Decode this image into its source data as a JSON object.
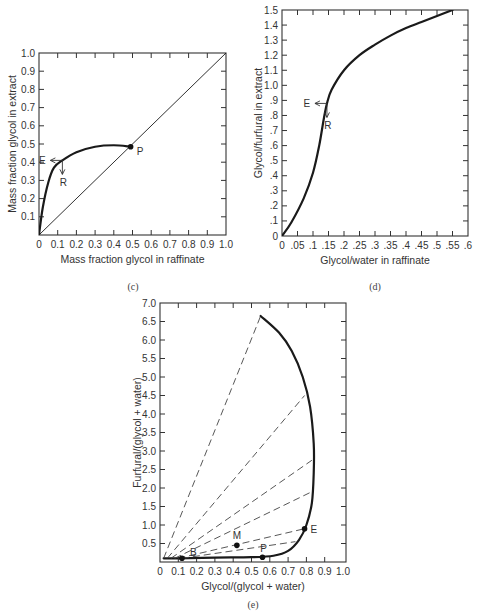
{
  "chart_data": [
    {
      "id": "c",
      "type": "line",
      "caption": "(c)",
      "xlabel": "Mass fraction glycol in raffinate",
      "ylabel": "Mass fraction glycol in extract",
      "xlim": [
        0,
        1.0
      ],
      "ylim": [
        0,
        1.0
      ],
      "xticks": [
        "0",
        "0.1",
        "0.2",
        "0.3",
        "0.4",
        "0.5",
        "0.6",
        "0.7",
        "0.8",
        "0.9",
        "1.0"
      ],
      "yticks": [
        "0.1",
        "0.2",
        "0.3",
        "0.4",
        "0.5",
        "0.6",
        "0.7",
        "0.8",
        "0.9",
        "1.0"
      ],
      "grid": false,
      "series": [
        {
          "name": "equilibrium curve",
          "style": "thick solid",
          "x": [
            0,
            0.02,
            0.05,
            0.08,
            0.125,
            0.2,
            0.3,
            0.4,
            0.49
          ],
          "y": [
            0,
            0.15,
            0.29,
            0.37,
            0.41,
            0.455,
            0.485,
            0.493,
            0.485
          ]
        },
        {
          "name": "45-degree line",
          "style": "thin solid",
          "x": [
            0,
            1.0
          ],
          "y": [
            0,
            1.0
          ]
        }
      ],
      "annotations": [
        {
          "label": "P",
          "x": 0.49,
          "y": 0.485,
          "marker": "dot"
        },
        {
          "label": "E",
          "x": 0.125,
          "y": 0.41,
          "arrow": "left"
        },
        {
          "label": "R",
          "x": 0.125,
          "y": 0.41,
          "arrow": "down"
        }
      ]
    },
    {
      "id": "d",
      "type": "line",
      "caption": "(d)",
      "xlabel": "Glycol/water in raffinate",
      "ylabel": "Glycol/furfural in extract",
      "xlim": [
        0,
        0.6
      ],
      "ylim": [
        0,
        1.5
      ],
      "xticks": [
        "0",
        ".05",
        ".1",
        ".15",
        ".2",
        ".25",
        ".3",
        ".35",
        ".4",
        ".45",
        ".5",
        ".55",
        ".6"
      ],
      "yticks": [
        "0",
        ".1",
        ".2",
        ".3",
        ".4",
        ".5",
        ".6",
        ".7",
        ".8",
        ".9",
        "1.0",
        "1.1",
        "1.2",
        "1.3",
        "1.4",
        "1.5"
      ],
      "grid": false,
      "series": [
        {
          "name": "equilibrium curve",
          "style": "thick solid",
          "x": [
            0,
            0.03,
            0.07,
            0.1,
            0.12,
            0.135,
            0.145,
            0.16,
            0.2,
            0.25,
            0.3,
            0.35,
            0.4,
            0.45,
            0.5,
            0.55
          ],
          "y": [
            0,
            0.09,
            0.25,
            0.42,
            0.6,
            0.78,
            0.88,
            0.97,
            1.1,
            1.2,
            1.27,
            1.33,
            1.38,
            1.42,
            1.46,
            1.5
          ]
        }
      ],
      "annotations": [
        {
          "label": "E",
          "x": 0.145,
          "y": 0.88,
          "arrow": "left"
        },
        {
          "label": "R",
          "x": 0.145,
          "y": 0.88,
          "arrow": "down"
        }
      ]
    },
    {
      "id": "e",
      "type": "line",
      "caption": "(e)",
      "xlabel": "Glycol/(glycol + water)",
      "ylabel": "Furfural/(glycol + water)",
      "xlim": [
        0,
        1.0
      ],
      "ylim": [
        0,
        7.0
      ],
      "xticks": [
        "0",
        "0.1",
        "0.2",
        "0.3",
        "0.4",
        "0.5",
        "0.6",
        "0.7",
        "0.8",
        "0.9",
        "1.0"
      ],
      "yticks": [
        "0.5",
        "1.0",
        "1.5",
        "2.0",
        "2.5",
        "3.0",
        "3.5",
        "4.0",
        "4.5",
        "5.0",
        "5.5",
        "6.0",
        "6.5",
        "7.0"
      ],
      "grid": false,
      "series": [
        {
          "name": "phase envelope",
          "style": "thick solid",
          "x": [
            0.02,
            0.1,
            0.3,
            0.5,
            0.62,
            0.7,
            0.76,
            0.8,
            0.83,
            0.84,
            0.84,
            0.82,
            0.78,
            0.72,
            0.65,
            0.55
          ],
          "y": [
            0.1,
            0.1,
            0.12,
            0.13,
            0.17,
            0.3,
            0.6,
            1.0,
            1.6,
            2.4,
            3.2,
            4.2,
            5.0,
            5.7,
            6.2,
            6.65
          ]
        },
        {
          "name": "tie lines",
          "style": "dashed",
          "lines": [
            {
              "from": [
                0.02,
                0.1
              ],
              "to": [
                0.55,
                6.65
              ]
            },
            {
              "from": [
                0.04,
                0.1
              ],
              "to": [
                0.79,
                4.5
              ]
            },
            {
              "from": [
                0.06,
                0.1
              ],
              "to": [
                0.83,
                2.75
              ]
            },
            {
              "from": [
                0.08,
                0.1
              ],
              "to": [
                0.83,
                1.9
              ]
            },
            {
              "from": [
                0.1,
                0.1
              ],
              "to": [
                0.79,
                0.9
              ]
            },
            {
              "from": [
                0.12,
                0.1
              ],
              "to": [
                0.74,
                0.55
              ]
            }
          ]
        }
      ],
      "annotations": [
        {
          "label": "B",
          "x": 0.12,
          "y": 0.1,
          "marker": "dot"
        },
        {
          "label": "M",
          "x": 0.42,
          "y": 0.45,
          "marker": "dot"
        },
        {
          "label": "P",
          "x": 0.56,
          "y": 0.13,
          "marker": "dot"
        },
        {
          "label": "E",
          "x": 0.79,
          "y": 0.9,
          "marker": "dot"
        }
      ]
    }
  ]
}
